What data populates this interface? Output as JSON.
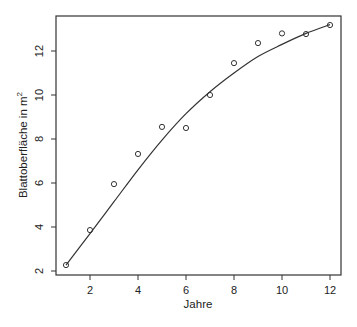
{
  "chart_data": {
    "type": "scatter",
    "title": "",
    "xlabel": "Jahre",
    "ylabel": "Blattoberfläche in m",
    "ylabel_superscript": "2",
    "xlim": [
      0.6,
      12.4
    ],
    "ylim": [
      1.8,
      13.6
    ],
    "x_ticks": [
      2,
      4,
      6,
      8,
      10,
      12
    ],
    "y_ticks": [
      2,
      4,
      6,
      8,
      10,
      12
    ],
    "grid": false,
    "legend": null,
    "series": [
      {
        "name": "Beobachtungen",
        "kind": "points",
        "marker": "open-circle",
        "x": [
          1,
          2,
          3,
          4,
          5,
          6,
          7,
          8,
          9,
          10,
          11,
          12
        ],
        "y": [
          2.27,
          3.86,
          5.95,
          7.32,
          8.55,
          8.5,
          10.0,
          11.45,
          12.36,
          12.8,
          12.77,
          13.18
        ]
      },
      {
        "name": "Anpassungskurve",
        "kind": "line",
        "x": [
          1,
          2,
          3,
          4,
          5,
          6,
          7,
          8,
          9,
          10,
          11,
          12
        ],
        "y": [
          2.27,
          3.7,
          5.15,
          6.6,
          7.95,
          9.15,
          10.15,
          11.0,
          11.75,
          12.3,
          12.8,
          13.2
        ]
      }
    ]
  }
}
